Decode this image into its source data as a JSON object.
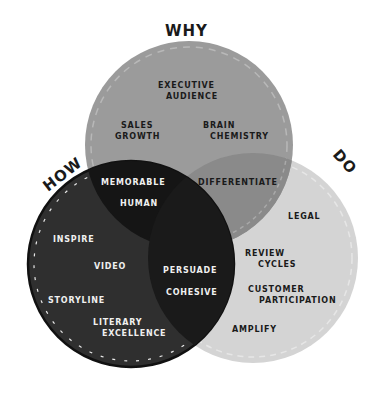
{
  "diagram": {
    "type": "venn",
    "circles": {
      "why": {
        "title": "WHY",
        "color": "#9b9b9b",
        "center": [
          189,
          145
        ],
        "r": 104
      },
      "how": {
        "title": "HOW",
        "color": "#2f2f2f",
        "center": [
          131,
          264
        ],
        "r": 103
      },
      "do": {
        "title": "DO",
        "color": "#d4d4d4",
        "center": [
          253,
          258
        ],
        "r": 105
      }
    },
    "overlap_colors": {
      "why_how": "#151515",
      "why_do": "#8a8a8a",
      "how_do": "#1a1a1a"
    },
    "regions": {
      "why_only": [
        "EXECUTIVE",
        "AUDIENCE",
        "SALES",
        "GROWTH",
        "BRAIN",
        "CHEMISTRY"
      ],
      "why_how": [
        "MEMORABLE",
        "HUMAN"
      ],
      "why_do": [
        "DIFFERENTIATE"
      ],
      "how_only": [
        "INSPIRE",
        "VIDEO",
        "STORYLINE",
        "LITERARY",
        "EXCELLENCE"
      ],
      "how_do": [
        "PERSUADE",
        "COHESIVE"
      ],
      "do_only": [
        "LEGAL",
        "REVIEW",
        "CYCLES",
        "CUSTOMER",
        "PARTICIPATION",
        "AMPLIFY"
      ]
    },
    "labels": {
      "why": "WHY",
      "how": "HOW",
      "do": "DO",
      "executive": "EXECUTIVE",
      "audience": "AUDIENCE",
      "sales": "SALES",
      "growth": "GROWTH",
      "brain": "BRAIN",
      "chemistry": "CHEMISTRY",
      "memorable": "MEMORABLE",
      "human": "HUMAN",
      "differentiate": "DIFFERENTIATE",
      "inspire": "INSPIRE",
      "video": "VIDEO",
      "storyline": "STORYLINE",
      "literary": "LITERARY",
      "excellence": "EXCELLENCE",
      "persuade": "PERSUADE",
      "cohesive": "COHESIVE",
      "legal": "LEGAL",
      "review": "REVIEW",
      "cycles": "CYCLES",
      "customer": "CUSTOMER",
      "participation": "PARTICIPATION",
      "amplify": "AMPLIFY"
    }
  }
}
